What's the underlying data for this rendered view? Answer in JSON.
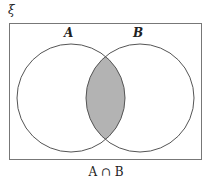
{
  "diagram": {
    "type": "venn",
    "universal_label": "ξ",
    "sets": [
      {
        "name": "A",
        "label": "A"
      },
      {
        "name": "B",
        "label": "B"
      }
    ],
    "shaded_region": "intersection",
    "caption": "A ∩ B",
    "colors": {
      "shade": "#b3b3b3",
      "stroke": "#555555"
    }
  }
}
